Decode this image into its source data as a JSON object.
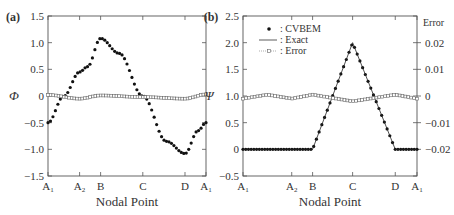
{
  "chart_data": [
    {
      "panel_label": "(a)",
      "type": "line",
      "title": "",
      "xlabel": "Nodal Point",
      "ylabel": "Φ",
      "ylim": [
        -1.5,
        1.5
      ],
      "yticks": [
        "1.5",
        "1.0",
        "0.5",
        "0",
        "−0.5",
        "−1.0",
        "−1.5"
      ],
      "xticks": [
        "A₁",
        "A₂",
        "B",
        "C",
        "D",
        "A₁"
      ],
      "xtick_positions": [
        0,
        0.2,
        0.333,
        0.6,
        0.867,
        1.0
      ],
      "grid": false,
      "series": [
        {
          "name": "CVBEM",
          "style": "filled-circle markers",
          "x": [
            0,
            0.1,
            0.2,
            0.25,
            0.333,
            0.45,
            0.6,
            0.75,
            0.867,
            0.95,
            1.0
          ],
          "values": [
            -0.5,
            0.0,
            0.45,
            0.55,
            1.08,
            0.8,
            0.0,
            -0.85,
            -1.08,
            -0.65,
            -0.5
          ]
        },
        {
          "name": "Error",
          "style": "open-square markers dotted",
          "x": [
            0,
            0.2,
            0.333,
            0.6,
            0.867,
            1.0
          ],
          "values": [
            0.02,
            -0.05,
            0.01,
            -0.02,
            -0.05,
            0.03
          ]
        }
      ]
    },
    {
      "panel_label": "(b)",
      "type": "line",
      "title": "",
      "xlabel": "Nodal Point",
      "ylabel": "Ψ",
      "ylim": [
        -0.5,
        2.5
      ],
      "yticks": [
        "2.5",
        "2.0",
        "1.5",
        "1.0",
        "0.5",
        "0",
        "−0.5"
      ],
      "y2label": "Error",
      "y2lim": [
        -0.02,
        0.02
      ],
      "y2ticks": [
        "0.02",
        "0.01",
        "0",
        "−0.01",
        "−0.02"
      ],
      "xticks": [
        "A₁",
        "A₂",
        "B",
        "C",
        "D",
        "A₁"
      ],
      "xtick_positions": [
        0,
        0.28,
        0.4,
        0.63,
        0.875,
        1.0
      ],
      "grid": false,
      "legend": [
        {
          "marker": "filled-circle",
          "label": ": CVBEM"
        },
        {
          "marker": "solid-line",
          "label": ": Exact"
        },
        {
          "marker": "open-square-dotted",
          "label": ": Error"
        }
      ],
      "legend_position": "upper left",
      "series": [
        {
          "name": "CVBEM",
          "style": "filled-circle markers",
          "x": [
            0,
            0.28,
            0.4,
            0.63,
            0.875,
            1.0
          ],
          "values": [
            0,
            0,
            0,
            2.0,
            0,
            0
          ]
        },
        {
          "name": "Exact",
          "style": "solid line",
          "x": [
            0,
            0.4,
            0.63,
            0.875,
            1.0
          ],
          "values": [
            0,
            0,
            2.0,
            0,
            0
          ]
        },
        {
          "name": "Error",
          "axis": "right",
          "style": "open-square markers dotted",
          "x": [
            0,
            0.14,
            0.28,
            0.4,
            0.63,
            0.875,
            1.0
          ],
          "values": [
            -0.001,
            0.0005,
            -0.001,
            0.0005,
            -0.002,
            0.0005,
            -0.001
          ]
        }
      ]
    }
  ]
}
